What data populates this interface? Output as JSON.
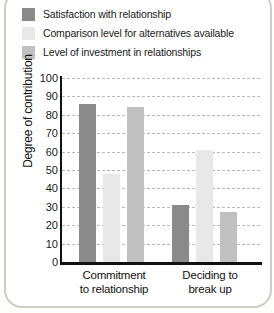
{
  "chart_data": {
    "type": "bar",
    "title": "",
    "xlabel": "",
    "ylabel": "Degree of contribution",
    "categories": [
      "Commitment to relationship",
      "Deciding to break up"
    ],
    "category_lines": [
      [
        "Commitment",
        "to relationship"
      ],
      [
        "Deciding to",
        "break up"
      ]
    ],
    "ylim": [
      0,
      100
    ],
    "yticks": [
      0,
      10,
      20,
      30,
      40,
      50,
      60,
      70,
      80,
      90,
      100
    ],
    "grid": true,
    "legend_position": "top-left",
    "series": [
      {
        "name": "Satisfaction with relationship",
        "color": "#8a8a8a",
        "values": [
          86,
          31
        ]
      },
      {
        "name": "Comparison level for alternatives available",
        "color": "#e8e8e8",
        "values": [
          48,
          61
        ]
      },
      {
        "name": "Level of investment in relationships",
        "color": "#c0c0c0",
        "values": [
          84,
          27
        ]
      }
    ]
  },
  "colors": {
    "axis": "#111111",
    "gridline": "#b9b9b9",
    "text": "#1a1a1a",
    "page_border": "#cfcdc8"
  }
}
